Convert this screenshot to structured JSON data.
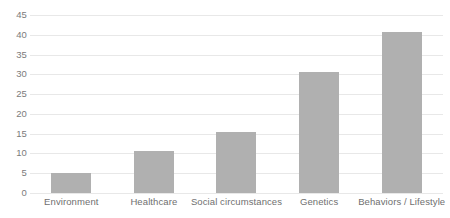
{
  "chart_data": {
    "type": "bar",
    "title": "",
    "subtitle": "",
    "xlabel": "",
    "ylabel": "",
    "categories": [
      "Environment",
      "Healthcare",
      "Social circumstances",
      "Genetics",
      "Behaviors / Lifestyle"
    ],
    "values": [
      5,
      10.5,
      15.3,
      30.5,
      40.7
    ],
    "ylim": [
      0,
      45
    ],
    "ytick_step": 5,
    "yticks": [
      0,
      5,
      10,
      15,
      20,
      25,
      30,
      35,
      40,
      45
    ],
    "ytick_labels": [
      "0",
      "5",
      "10",
      "15",
      "20",
      "25",
      "30",
      "35",
      "40",
      "45"
    ],
    "grid": "horizontal",
    "legend": "none",
    "bar_color": "#b0b0b0",
    "gridline_color": "#e8e8e8",
    "tick_label_color": "#7b7b7b",
    "category_label_color": "#6f6f6f",
    "background_color": "#ffffff"
  }
}
